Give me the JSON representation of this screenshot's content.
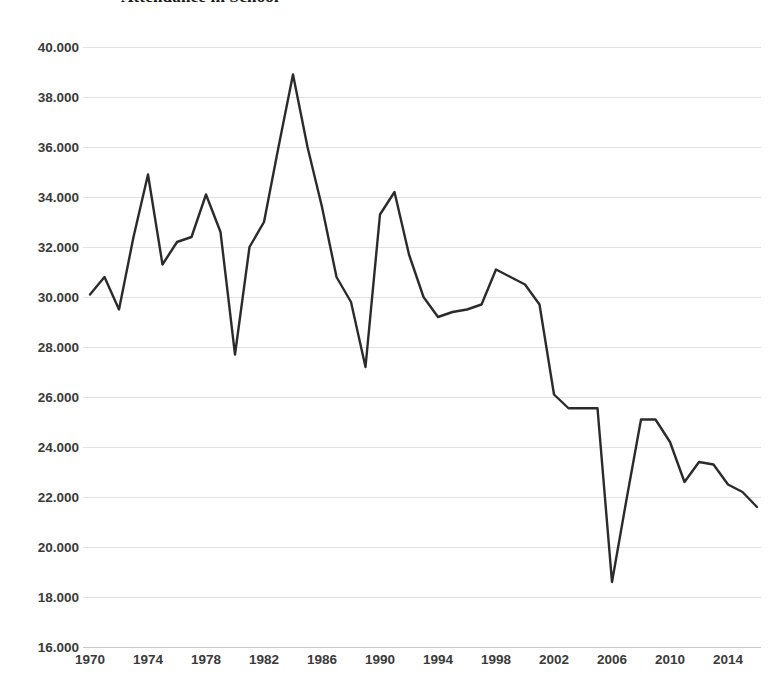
{
  "chart_data": {
    "type": "line",
    "title": "Attendance in School",
    "xlabel": "",
    "ylabel": "",
    "grid": true,
    "legend": "none",
    "xlim": [
      1970,
      2016
    ],
    "ylim": [
      16000,
      40000
    ],
    "y_ticks": [
      "16.000",
      "18.000",
      "20.000",
      "22.000",
      "24.000",
      "26.000",
      "28.000",
      "30.000",
      "32.000",
      "34.000",
      "36.000",
      "38.000",
      "40.000"
    ],
    "y_tick_values": [
      16000,
      18000,
      20000,
      22000,
      24000,
      26000,
      28000,
      30000,
      32000,
      34000,
      36000,
      38000,
      40000
    ],
    "x_ticks": [
      "1970",
      "1974",
      "1978",
      "1982",
      "1986",
      "1990",
      "1994",
      "1998",
      "2002",
      "2006",
      "2010",
      "2014"
    ],
    "x_tick_values": [
      1970,
      1974,
      1978,
      1982,
      1986,
      1990,
      1994,
      1998,
      2002,
      2006,
      2010,
      2014
    ],
    "line_color": "#2b2b2b",
    "line_width": 2.4,
    "grid_color": "#e2e2e2",
    "x": [
      1970,
      1971,
      1972,
      1973,
      1974,
      1975,
      1976,
      1977,
      1978,
      1979,
      1980,
      1981,
      1982,
      1983,
      1984,
      1985,
      1986,
      1987,
      1988,
      1989,
      1990,
      1991,
      1992,
      1993,
      1994,
      1995,
      1996,
      1997,
      1998,
      1999,
      2000,
      2001,
      2002,
      2003,
      2004,
      2005,
      2006,
      2007,
      2008,
      2009,
      2010,
      2011,
      2012,
      2013,
      2014,
      2015,
      2016
    ],
    "values": [
      30100,
      30800,
      29500,
      32400,
      34900,
      31300,
      32200,
      32400,
      34100,
      32600,
      27700,
      32000,
      33000,
      36000,
      38900,
      36000,
      33600,
      30800,
      29800,
      27200,
      33300,
      34200,
      31700,
      30000,
      29200,
      29400,
      29500,
      29700,
      31100,
      30800,
      30500,
      29700,
      26100,
      25550,
      25550,
      25550,
      18600,
      21900,
      25100,
      25100,
      24200,
      22600,
      23400,
      23300,
      22500,
      22200,
      21600
    ],
    "annotations": [
      {
        "label": "peak",
        "x": 1984,
        "y": 38900
      },
      {
        "label": "trough",
        "x": 2006,
        "y": 18600
      }
    ]
  },
  "axes": {
    "y_title": "",
    "x_title": ""
  }
}
